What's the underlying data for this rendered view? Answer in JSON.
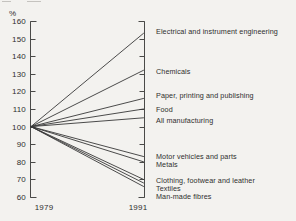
{
  "figure": {
    "kind": "scanned statistical fan chart",
    "background_color": "#f3f2ef",
    "line_color": "#383838",
    "text_color": "#2e2e2e"
  },
  "axis": {
    "percent_label": "%",
    "x_left_label": "1979",
    "x_right_label": "1991"
  },
  "chart_data": {
    "type": "line",
    "variant": "fan-index-chart",
    "title": "",
    "xlabel": "",
    "ylabel": "%",
    "x_categories": [
      "1979",
      "1991"
    ],
    "baseline_value": 100,
    "ylim": [
      60,
      160
    ],
    "yticks": [
      60,
      70,
      80,
      90,
      100,
      110,
      120,
      130,
      140,
      150,
      160
    ],
    "grid": false,
    "legend_position": "right-inline-labels",
    "series": [
      {
        "name": "Electrical and instrument engineering",
        "values": [
          100,
          153
        ]
      },
      {
        "name": "Chemicals",
        "values": [
          100,
          132
        ]
      },
      {
        "name": "Paper, printing and publishing",
        "values": [
          100,
          116
        ]
      },
      {
        "name": "Food",
        "values": [
          100,
          110
        ]
      },
      {
        "name": "All manufacturing",
        "values": [
          100,
          105
        ]
      },
      {
        "name": "Motor vehicles and parts",
        "values": [
          100,
          83
        ]
      },
      {
        "name": "Metals",
        "values": [
          100,
          80
        ]
      },
      {
        "name": "Clothing, footwear and leather",
        "values": [
          100,
          70
        ]
      },
      {
        "name": "Textiles",
        "values": [
          100,
          68
        ]
      },
      {
        "name": "Man-made fibres",
        "values": [
          100,
          66
        ]
      }
    ]
  }
}
